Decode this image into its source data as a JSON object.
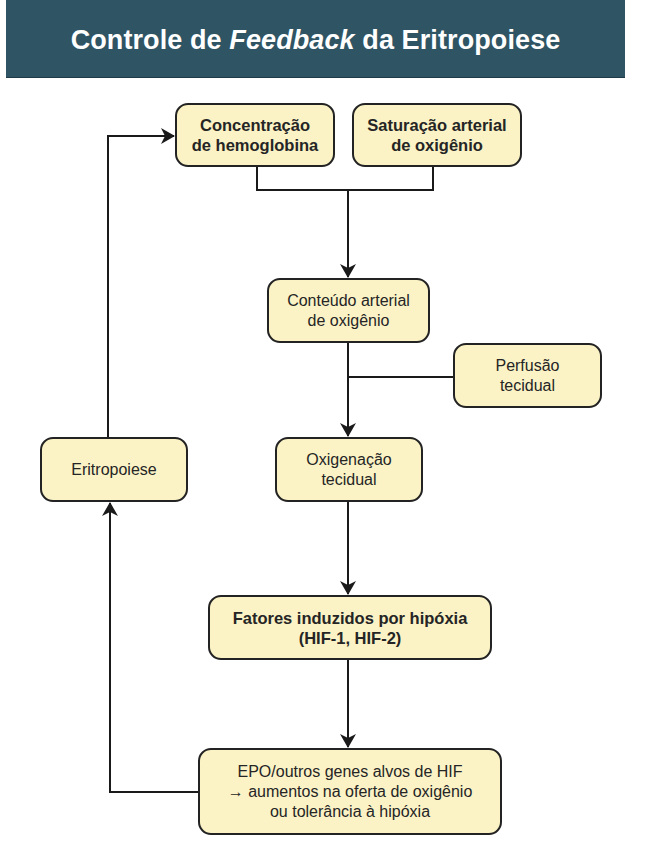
{
  "header": {
    "title_before": "Controle de ",
    "title_italic": "Feedback",
    "title_after": " da Eritropoiese",
    "background_color": "#2f5464"
  },
  "nodes": {
    "hemoglobin": {
      "line1": "Concentração",
      "line2": "de hemoglobina",
      "bold": true
    },
    "saturation": {
      "line1": "Saturação arterial",
      "line2": "de oxigênio",
      "bold": true
    },
    "content": {
      "line1": "Conteúdo arterial",
      "line2": "de oxigênio",
      "bold": false
    },
    "perfusion": {
      "line1": "Perfusão",
      "line2": "tecidual",
      "bold": false
    },
    "oxygenation": {
      "line1": "Oxigenação",
      "line2": "tecidual",
      "bold": false
    },
    "erythropoiesis": {
      "line1": "Eritropoiese",
      "bold": false
    },
    "hif": {
      "line1": "Fatores induzidos por hipóxia",
      "line2": "(HIF-1, HIF-2)",
      "bold": true
    },
    "epo": {
      "line1": "EPO/outros genes alvos de HIF",
      "line2": "→ aumentos na oferta de oxigênio",
      "line3": "ou tolerância à hipóxia",
      "bold": false
    }
  },
  "edges": [
    {
      "from": "hemoglobin",
      "to": "content"
    },
    {
      "from": "saturation",
      "to": "content"
    },
    {
      "from": "content",
      "to": "oxygenation"
    },
    {
      "from": "perfusion",
      "to": "oxygenation"
    },
    {
      "from": "oxygenation",
      "to": "hif"
    },
    {
      "from": "hif",
      "to": "epo"
    },
    {
      "from": "epo",
      "to": "erythropoiesis"
    },
    {
      "from": "erythropoiesis",
      "to": "hemoglobin"
    }
  ],
  "colors": {
    "box_fill": "#fbf3c5",
    "box_border": "#232323",
    "line": "#1a1a1a"
  }
}
